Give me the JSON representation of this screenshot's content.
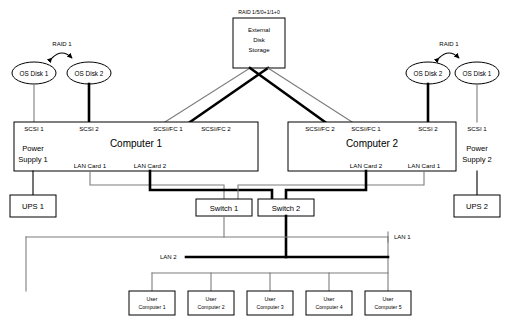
{
  "diagram": {
    "raid_label_left": "RAID 1",
    "raid_label_right": "RAID 1",
    "storage_raid_label": "RAID 1/5/0+1/1+0",
    "storage": {
      "line1": "External",
      "line2": "Disk",
      "line3": "Storage"
    },
    "os_disks_left": [
      {
        "label": "OS Disk 1"
      },
      {
        "label": "OS Disk 2"
      }
    ],
    "os_disks_right": [
      {
        "label": "OS Disk 2"
      },
      {
        "label": "OS Disk 1"
      }
    ],
    "computer1": {
      "name": "Computer 1",
      "ports": [
        {
          "label": "SCSI 1"
        },
        {
          "label": "SCSI 2"
        },
        {
          "label": "SCSI/FC 1"
        },
        {
          "label": "SCSI/FC 2"
        }
      ],
      "power_supply_line1": "Power",
      "power_supply_line2": "Supply 1",
      "lan_cards": [
        {
          "label": "LAN Card 1"
        },
        {
          "label": "LAN Card 2"
        }
      ]
    },
    "computer2": {
      "name": "Computer 2",
      "ports": [
        {
          "label": "SCSI/FC 2"
        },
        {
          "label": "SCSI/FC 1"
        },
        {
          "label": "SCSI 2"
        },
        {
          "label": "SCSI 1"
        }
      ],
      "power_supply_line1": "Power",
      "power_supply_line2": "Supply 2",
      "lan_cards": [
        {
          "label": "LAN Card 2"
        },
        {
          "label": "LAN Card 1"
        }
      ]
    },
    "ups": [
      {
        "label": "UPS 1"
      },
      {
        "label": "UPS 2"
      }
    ],
    "switches": [
      {
        "label": "Switch 1"
      },
      {
        "label": "Switch 2"
      }
    ],
    "lan_labels": {
      "lan1": "LAN 1",
      "lan2": "LAN 2"
    },
    "user_computers": [
      {
        "line1": "User",
        "line2": "Computer 1"
      },
      {
        "line1": "User",
        "line2": "Computer 2"
      },
      {
        "line1": "User",
        "line2": "Computer 3"
      },
      {
        "line1": "User",
        "line2": "Computer 4"
      },
      {
        "line1": "User",
        "line2": "Computer 5"
      }
    ],
    "colors": {
      "line_thin": "#7d7d7d",
      "line_thick": "#000000",
      "box_fill": "#ffffff",
      "box_stroke": "#000000",
      "background": "#ffffff"
    }
  }
}
